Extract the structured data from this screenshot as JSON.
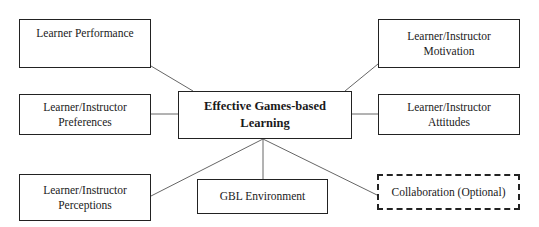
{
  "diagram": {
    "type": "hub-and-spoke",
    "center": {
      "id": "effective-gbl",
      "label": "Effective Games-based\nLearning"
    },
    "nodes": [
      {
        "id": "learner-performance",
        "label": "Learner Performance",
        "style": "solid"
      },
      {
        "id": "motivation",
        "label": "Learner/Instructor\nMotivation",
        "style": "solid"
      },
      {
        "id": "preferences",
        "label": "Learner/Instructor\nPreferences",
        "style": "solid"
      },
      {
        "id": "attitudes",
        "label": "Learner/Instructor\nAttitudes",
        "style": "solid"
      },
      {
        "id": "perceptions",
        "label": "Learner/Instructor\nPerceptions",
        "style": "solid"
      },
      {
        "id": "gbl-environment",
        "label": "GBL Environment",
        "style": "solid"
      },
      {
        "id": "collaboration",
        "label": "Collaboration (Optional)",
        "style": "dashed"
      }
    ],
    "edges": [
      {
        "from": "effective-gbl",
        "to": "learner-performance"
      },
      {
        "from": "effective-gbl",
        "to": "motivation"
      },
      {
        "from": "effective-gbl",
        "to": "preferences"
      },
      {
        "from": "effective-gbl",
        "to": "attitudes"
      },
      {
        "from": "effective-gbl",
        "to": "perceptions"
      },
      {
        "from": "effective-gbl",
        "to": "gbl-environment"
      },
      {
        "from": "effective-gbl",
        "to": "collaboration"
      }
    ],
    "colors": {
      "line": "#666666",
      "border": "#222222",
      "background": "#ffffff"
    }
  }
}
